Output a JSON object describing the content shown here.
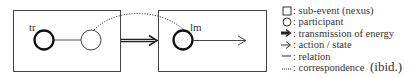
{
  "diagram": {
    "left_box": {
      "trajector_label": "tr"
    },
    "right_box": {
      "landmark_label": "lm"
    }
  },
  "legend": {
    "items": [
      {
        "icon": "square-icon",
        "label": ": sub-event (nexus)"
      },
      {
        "icon": "circle-icon",
        "label": ": participant"
      },
      {
        "icon": "double-arrow-icon",
        "label": ": transmission of energy"
      },
      {
        "icon": "arrow-icon",
        "label": ": action / state"
      },
      {
        "icon": "line-icon",
        "label": ": relation"
      },
      {
        "icon": "dotted-line-icon",
        "label": ": correspondence"
      }
    ],
    "source": "(ibid.)"
  },
  "colors": {
    "line": "#333333",
    "thick": "#111111",
    "light": "#555555"
  }
}
